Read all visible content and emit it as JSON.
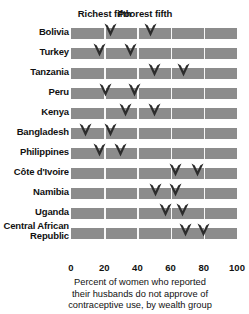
{
  "chart_data": {
    "type": "scatter",
    "title": "",
    "xlabel": "Percent of women who reported their husbands do not approve of contraceptive use, by wealth group",
    "ylabel": "",
    "xlim": [
      0,
      100
    ],
    "grid": true,
    "legend_position": "top",
    "categories": [
      "Bolivia",
      "Turkey",
      "Tanzania",
      "Peru",
      "Kenya",
      "Bangladesh",
      "Philippines",
      "Côte d'Ivoire",
      "Namibia",
      "Uganda",
      "Central African Republic"
    ],
    "series": [
      {
        "name": "Richest fifth",
        "values": [
          24,
          17,
          50,
          21,
          33,
          9,
          17,
          63,
          51,
          57,
          69
        ]
      },
      {
        "name": "Poorest fifth",
        "values": [
          48,
          36,
          68,
          38,
          50,
          24,
          30,
          76,
          63,
          67,
          80
        ]
      }
    ],
    "xticks": [
      0,
      20,
      40,
      60,
      80,
      100
    ],
    "xtick_labels": [
      "0",
      "20",
      "40",
      "60",
      "80",
      "100"
    ]
  },
  "legend": {
    "richest": "Richest fifth",
    "poorest": "Poorest fifth"
  },
  "caption": {
    "line1": "Percent of women who reported",
    "line2": "their husbands do not approve of",
    "line3": "contraceptive use, by wealth group"
  },
  "colors": {
    "track": "#8c8c8c",
    "marker": "#2b2b2b",
    "gridline": "#ffffff",
    "text": "#111111",
    "background": "#ffffff"
  },
  "icons": {
    "marker": "down-chevron-marker"
  }
}
